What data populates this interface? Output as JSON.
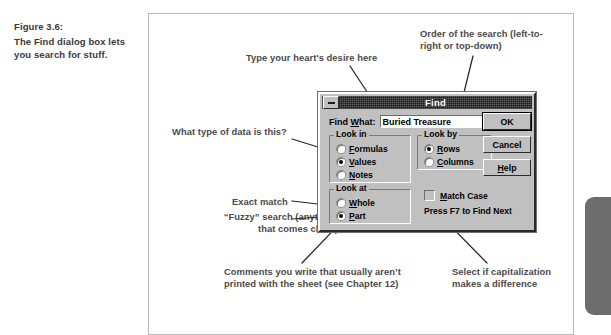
{
  "caption": {
    "figure_number": "Figure 3.6:",
    "text": "The Find dialog box lets you search for stuff."
  },
  "annotations": {
    "type_here": "Type your heart's desire here",
    "order_of_search": "Order of the search (left-to-\nright or top-down)",
    "data_type": "What type of data is this?",
    "exact_match": "Exact match",
    "fuzzy_search": "“Fuzzy” search (anything\nthat comes close)",
    "comments": "Comments you write that usually aren’t\nprinted with the sheet (see Chapter 12)",
    "capitalization": "Select if capitalization\nmakes a difference"
  },
  "dialog": {
    "title": "Find",
    "minimize_icon": "minimize-icon",
    "find_what": {
      "label": "Find What:",
      "label_accel": "W",
      "value": "Buried Treasure",
      "placeholder": ""
    },
    "look_in": {
      "title": "Look in",
      "options": [
        {
          "label": "Formulas",
          "accel": "F",
          "selected": false
        },
        {
          "label": "Values",
          "accel": "V",
          "selected": true
        },
        {
          "label": "Notes",
          "accel": "N",
          "selected": false
        }
      ]
    },
    "look_by": {
      "title": "Look by",
      "options": [
        {
          "label": "Rows",
          "accel": "R",
          "selected": true
        },
        {
          "label": "Columns",
          "accel": "C",
          "selected": false
        }
      ]
    },
    "look_at": {
      "title": "Look at",
      "options": [
        {
          "label": "Whole",
          "accel": "W",
          "selected": false
        },
        {
          "label": "Part",
          "accel": "P",
          "selected": true
        }
      ]
    },
    "match_case": {
      "label": "Match Case",
      "accel": "M",
      "checked": false
    },
    "hint": "Press F7 to Find Next",
    "buttons": [
      {
        "label": "OK",
        "accel": "",
        "default": true
      },
      {
        "label": "Cancel",
        "accel": "",
        "default": false
      },
      {
        "label": "Help",
        "accel": "H",
        "default": false
      }
    ]
  },
  "colors": {
    "dialog_face": "#c0c0c0",
    "titlebar": "#1b1b1b",
    "frame_border": "#b9b9b9",
    "annotation_text": "#4a4a4a",
    "caption_text": "#3a3a3a",
    "page_tab": "#6d6d6d"
  }
}
